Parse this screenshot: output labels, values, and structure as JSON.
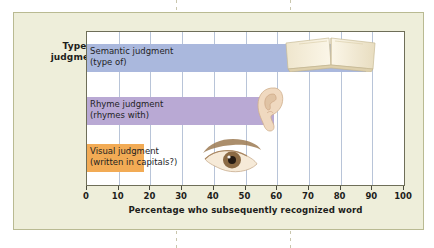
{
  "figure": {
    "background_color": "#eeeeda",
    "border_color": "#b9ba92",
    "plot_background": "#ffffff",
    "gridline_color": "#b8c4d8"
  },
  "axis": {
    "y_title_line1": "Type of",
    "y_title_line2": "judgment",
    "x_title": "Percentage who subsequently recognized word"
  },
  "icons": {
    "book": "open-book-icon",
    "ear": "ear-icon",
    "eye": "eye-icon"
  },
  "chart_data": {
    "type": "bar",
    "orientation": "horizontal",
    "title": "",
    "xlabel": "Percentage who subsequently recognized word",
    "ylabel": "Type of judgment",
    "xlim": [
      0,
      100
    ],
    "xticks": [
      0,
      10,
      20,
      30,
      40,
      50,
      60,
      70,
      80,
      90,
      100
    ],
    "grid": "vertical",
    "legend": "none",
    "categories": [
      "Semantic judgment (type of)",
      "Rhyme judgment (rhymes with)",
      "Visual judgment (written in capitals?)"
    ],
    "values": [
      88,
      59,
      18
    ],
    "bars": [
      {
        "label_line1": "Semantic judgment",
        "label_line2": "(type of)",
        "value": 88,
        "color": "#aab8dd",
        "icon": "open-book-icon"
      },
      {
        "label_line1": "Rhyme judgment",
        "label_line2": "(rhymes with)",
        "value": 59,
        "color": "#b9a9d4",
        "icon": "ear-icon"
      },
      {
        "label_line1": "Visual judgment",
        "label_line2": "(written in capitals?)",
        "value": 18,
        "color": "#f2ab55",
        "icon": "eye-icon"
      }
    ]
  }
}
